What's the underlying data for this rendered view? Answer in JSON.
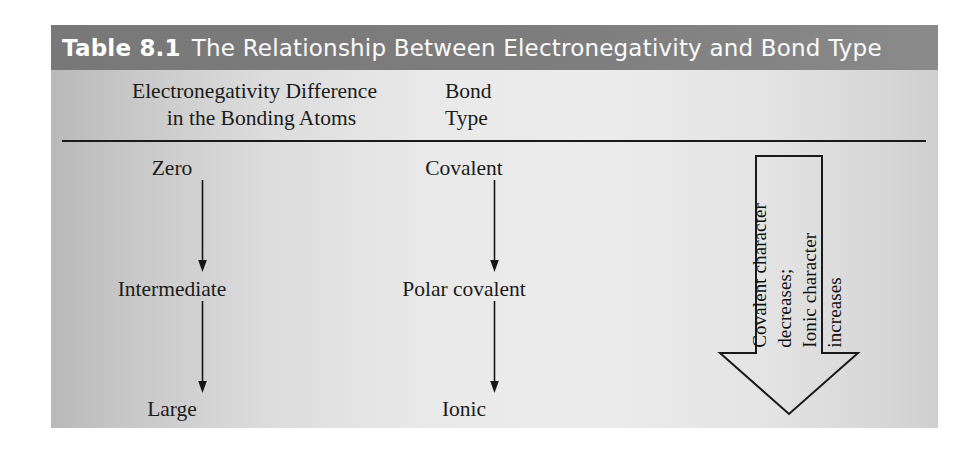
{
  "title": {
    "label_number": "Table 8.1",
    "text": "The Relationship Between Electronegativity and Bond Type"
  },
  "headers": {
    "col1_line1": "Electronegativity Difference",
    "col1_line2": "in the Bonding Atoms",
    "col2_line1": "Bond",
    "col2_line2": "Type"
  },
  "rows": [
    {
      "electronegativity_difference": "Zero",
      "bond_type": "Covalent"
    },
    {
      "electronegativity_difference": "Intermediate",
      "bond_type": "Polar covalent"
    },
    {
      "electronegativity_difference": "Large",
      "bond_type": "Ionic"
    }
  ],
  "annotation": {
    "arrow_label": "Covalent character\ndecreases;\nIonic character\nincreases",
    "direction": "down"
  },
  "colors": {
    "title_bar": "#7d7d7d",
    "title_text": "#ffffff",
    "body_text": "#1b1b1b",
    "rule": "#1a1a1a",
    "panel_left": "#b9b9b9",
    "panel_right": "#cfcfcf"
  }
}
